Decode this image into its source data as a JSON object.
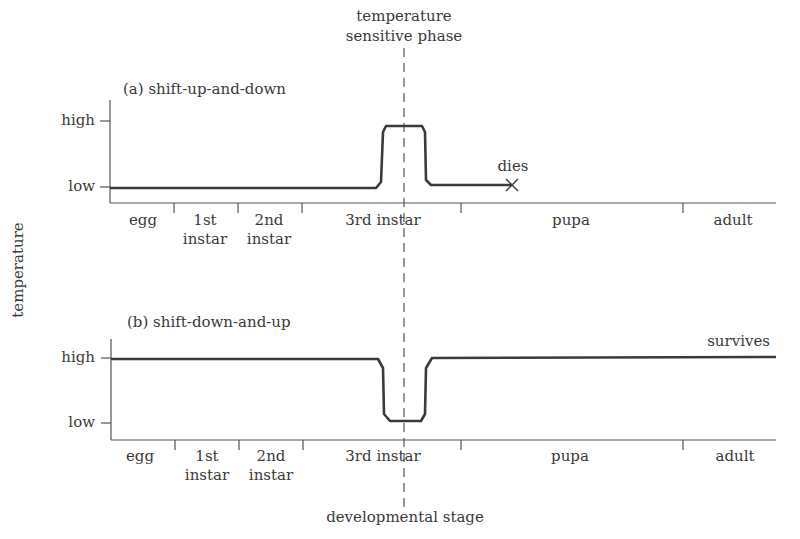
{
  "header": {
    "phase_label_line1": "temperature",
    "phase_label_line2": "sensitive phase"
  },
  "axes": {
    "ylabel": "temperature",
    "xlabel": "developmental stage",
    "y_ticks": [
      "high",
      "low"
    ]
  },
  "panel_a": {
    "title": "(a)  shift-up-and-down",
    "outcome": "dies",
    "stages": [
      "egg",
      "1st\ninstar",
      "2nd\ninstar",
      "3rd instar",
      "pupa",
      "adult"
    ],
    "stage_labels": {
      "egg": "egg",
      "first_l1": "1st",
      "first_l2": "instar",
      "second_l1": "2nd",
      "second_l2": "instar",
      "third": "3rd instar",
      "pupa": "pupa",
      "adult": "adult"
    },
    "high": "high",
    "low": "low"
  },
  "panel_b": {
    "title": "(b)  shift-down-and-up",
    "outcome": "survives",
    "stage_labels": {
      "egg": "egg",
      "first_l1": "1st",
      "first_l2": "instar",
      "second_l1": "2nd",
      "second_l2": "instar",
      "third": "3rd instar",
      "pupa": "pupa",
      "adult": "adult"
    },
    "high": "high",
    "low": "low"
  },
  "colors": {
    "line": "#3a3a3a",
    "axis": "#555555"
  }
}
